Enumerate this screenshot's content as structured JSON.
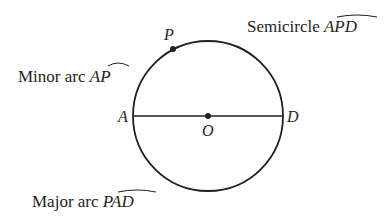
{
  "diagram": {
    "type": "circle-arcs",
    "circle": {
      "cx": 208,
      "cy": 116,
      "r": 75
    },
    "points": {
      "P": {
        "label": "P",
        "x": 173,
        "y": 48
      },
      "A": {
        "label": "A",
        "x": 133,
        "y": 116
      },
      "O": {
        "label": "O",
        "x": 208,
        "y": 116
      },
      "D": {
        "label": "D",
        "x": 283,
        "y": 116
      }
    },
    "captions": {
      "minor_arc": {
        "prefix": "Minor arc ",
        "arc": "AP"
      },
      "semicircle": {
        "prefix": "Semicircle ",
        "arc": "APD"
      },
      "major_arc": {
        "prefix": "Major arc ",
        "arc": "PAD"
      }
    },
    "colors": {
      "ink": "#231f20",
      "background": "#ffffff"
    }
  }
}
